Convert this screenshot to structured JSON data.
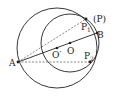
{
  "diagram": {
    "type": "geometry-two-circles",
    "points": {
      "A": {
        "label": "A",
        "x": 18,
        "y": 62
      },
      "B": {
        "label": "B",
        "x": 97,
        "y": 33
      },
      "O": {
        "label": "O",
        "x": 70,
        "y": 43
      },
      "O_prime": {
        "label": "O′",
        "x": 57,
        "y": 48
      },
      "P1": {
        "label": "P",
        "sub": "1",
        "x": 86,
        "y": 19
      },
      "P2": {
        "label": "P",
        "sub": "2",
        "x": 90,
        "y": 62
      },
      "P_note": {
        "label": "(P)"
      }
    },
    "circles": [
      {
        "name": "large-circle",
        "center": "O_prime",
        "r": 40
      },
      {
        "name": "small-circle",
        "center": "O",
        "r": 29
      }
    ],
    "segments": [
      {
        "from": "A",
        "to": "B",
        "style": "solid"
      },
      {
        "from": "A",
        "to": "P1",
        "style": "dashed"
      },
      {
        "from": "A",
        "to": "P2",
        "style": "dashed"
      }
    ],
    "colors": {
      "stroke": "#222222",
      "dash": "#555555"
    }
  }
}
